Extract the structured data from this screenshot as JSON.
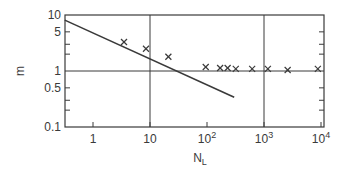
{
  "chart_data": {
    "type": "scatter",
    "title": "",
    "xlabel": "N_L",
    "ylabel": "m",
    "xscale": "log",
    "yscale": "log",
    "xlim": [
      0.32,
      13000
    ],
    "ylim": [
      0.1,
      10
    ],
    "x_ticks": [
      {
        "value": 1,
        "label": "1"
      },
      {
        "value": 10,
        "label": "10"
      },
      {
        "value": 100,
        "label": "10",
        "sup": "2"
      },
      {
        "value": 1000,
        "label": "10",
        "sup": "3"
      },
      {
        "value": 10000,
        "label": "10",
        "sup": "4"
      }
    ],
    "y_ticks": [
      {
        "value": 10,
        "label": "10"
      },
      {
        "value": 5,
        "label": "5"
      },
      {
        "value": 1,
        "label": "1"
      },
      {
        "value": 0.5,
        "label": "0.5"
      },
      {
        "value": 0.1,
        "label": "0.1"
      }
    ],
    "y_minor_ticks": [
      5,
      3,
      2,
      0.5,
      0.3,
      0.2
    ],
    "grid": {
      "vertical_lines_at": [
        10,
        1000
      ],
      "horizontal_lines_at": [
        1
      ]
    },
    "legend": null,
    "series": [
      {
        "name": "measured",
        "marker": "x",
        "points": [
          {
            "x": 3.5,
            "y": 3.3
          },
          {
            "x": 8.5,
            "y": 2.5
          },
          {
            "x": 21,
            "y": 1.8
          },
          {
            "x": 95,
            "y": 1.18
          },
          {
            "x": 170,
            "y": 1.13
          },
          {
            "x": 230,
            "y": 1.13
          },
          {
            "x": 320,
            "y": 1.09
          },
          {
            "x": 620,
            "y": 1.09
          },
          {
            "x": 1170,
            "y": 1.09
          },
          {
            "x": 2600,
            "y": 1.04
          },
          {
            "x": 8800,
            "y": 1.09
          }
        ]
      },
      {
        "name": "fit-line",
        "type": "line",
        "points": [
          {
            "x": 0.32,
            "y": 8.1
          },
          {
            "x": 300,
            "y": 0.34
          }
        ]
      }
    ]
  },
  "labels": {
    "xlabel_main": "N",
    "xlabel_sub": "L",
    "ylabel": "m"
  },
  "colors": {
    "axis": "#3a3a3a",
    "marker": "#3a3a3a",
    "background": "#ffffff"
  }
}
